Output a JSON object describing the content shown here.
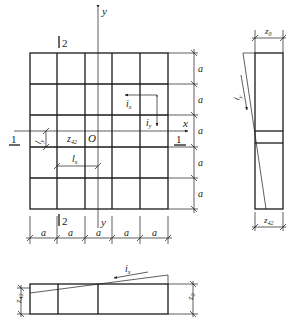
{
  "diagram": {
    "type": "plan-and-sections",
    "plan": {
      "axis_x_label": "x",
      "axis_y_label": "y",
      "origin_label": "O",
      "section_1_label": "1",
      "section_2_label": "2",
      "grid_spacing_label": "a",
      "columns": 5,
      "rows": 5,
      "bottom_dims": [
        "a",
        "a",
        "a",
        "a",
        "a"
      ],
      "right_dims": [
        "a",
        "a",
        "a",
        "a",
        "a"
      ],
      "slope_x_label": "i",
      "slope_x_sub": "x",
      "slope_y_label": "i",
      "slope_y_sub": "y",
      "length_x_label": "l",
      "length_x_sub": "x",
      "length_y_label": "l",
      "length_y_sub": "y",
      "point_label": "z",
      "point_sub": "42"
    },
    "section_right": {
      "top_dim_label": "z",
      "top_dim_sub": "0",
      "bottom_dim_label": "z",
      "bottom_dim_sub": "42",
      "slope_label": "i",
      "slope_sub": "y"
    },
    "section_bottom": {
      "left_dim_label": "z",
      "left_dim_sub": "42",
      "right_dim_label": "z",
      "right_dim_sub": "0",
      "slope_label": "i",
      "slope_sub": "x"
    }
  }
}
